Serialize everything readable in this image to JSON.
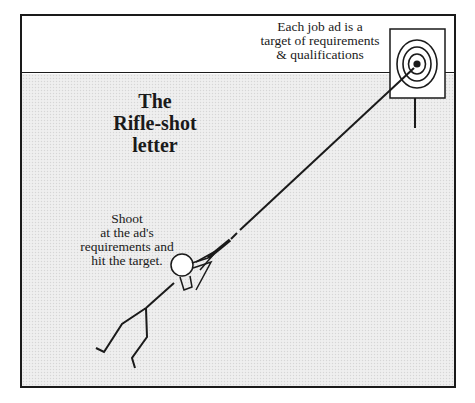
{
  "title": {
    "lines": [
      "The",
      "Rifle-shot",
      "letter"
    ]
  },
  "captions": {
    "target": [
      "Each job ad is a",
      "target of requirements",
      "& qualifications"
    ],
    "shooter": [
      "Shoot",
      "at the ad's",
      "requirements and",
      "hit the target."
    ]
  },
  "colors": {
    "ink": "#1a1a1a",
    "background": "#ffffff",
    "shaded_area": "#ececec"
  },
  "elements": {
    "target": "bullseye-target-on-post",
    "figure": "stick-figure-with-rifle",
    "shot_line": "bullet-trajectory-line"
  }
}
